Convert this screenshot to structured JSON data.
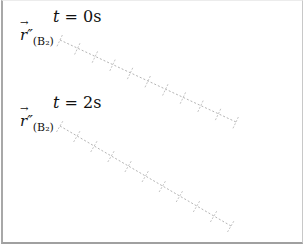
{
  "diagram": {
    "panels": [
      {
        "time_var": "t",
        "time_eq": " = ",
        "time_value": "0",
        "time_unit": "s",
        "vector_symbol": "r",
        "vector_primes": "″",
        "vector_subscript": "(B₂)",
        "arrow": "→",
        "line": {
          "x1": 60,
          "y1": 40,
          "x2": 236,
          "y2": 122,
          "ticks": 11
        }
      },
      {
        "time_var": "t",
        "time_eq": " = ",
        "time_value": "2",
        "time_unit": "s",
        "vector_symbol": "r",
        "vector_primes": "″",
        "vector_subscript": "(B₂)",
        "arrow": "→",
        "line": {
          "x1": 60,
          "y1": 126,
          "x2": 231,
          "y2": 226,
          "ticks": 11
        }
      }
    ],
    "colors": {
      "border": "#a8a8a8",
      "line": "#b4b4b4",
      "text": "#111111"
    }
  }
}
